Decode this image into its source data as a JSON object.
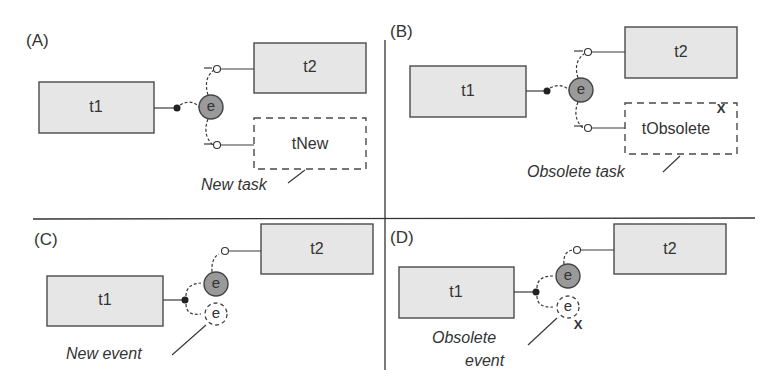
{
  "panels": [
    {
      "id": "A",
      "label": "(A)",
      "tasks": [
        "t1",
        "t2",
        "tNew"
      ],
      "event": "e",
      "annotation": "New task"
    },
    {
      "id": "B",
      "label": "(B)",
      "tasks": [
        "t1",
        "t2",
        "tObsolete"
      ],
      "event": "e",
      "annotation": "Obsolete task",
      "obsolete_mark": "X"
    },
    {
      "id": "C",
      "label": "(C)",
      "tasks": [
        "t1",
        "t2"
      ],
      "event": "e",
      "new_event": "e",
      "annotation": "New event"
    },
    {
      "id": "D",
      "label": "(D)",
      "tasks": [
        "t1",
        "t2"
      ],
      "event": "e",
      "new_event": "e",
      "annotation_line1": "Obsolete",
      "annotation_line2": "event",
      "obsolete_mark": "X"
    }
  ],
  "colors": {
    "task_fill": "#e6e6e6",
    "event_fill": "#9a9a9a",
    "stroke": "#3a3a3a"
  }
}
